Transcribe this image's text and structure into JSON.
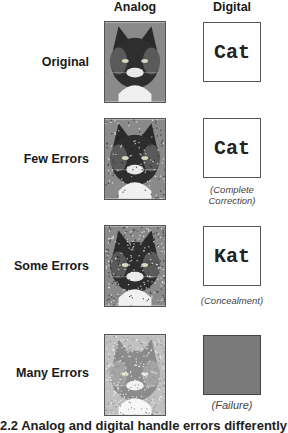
{
  "columns": {
    "analog": "Analog",
    "digital": "Digital"
  },
  "rows": [
    {
      "label": "Original",
      "digital_text": "Cat",
      "note": "",
      "noise": 0.0,
      "failure": false
    },
    {
      "label": "Few Errors",
      "digital_text": "Cat",
      "note": "(Complete Correction)",
      "noise": 0.25,
      "failure": false
    },
    {
      "label": "Some Errors",
      "digital_text": "Kat",
      "note": "(Concealment)",
      "noise": 0.45,
      "failure": false
    },
    {
      "label": "Many Errors",
      "digital_text": "",
      "note": "(Failure)",
      "noise": 0.65,
      "failure": true
    }
  ],
  "colors": {
    "failure_fill": "#7a7a7a",
    "frame": "#555555"
  },
  "caption": "2.2 Analog and digital handle errors differently"
}
